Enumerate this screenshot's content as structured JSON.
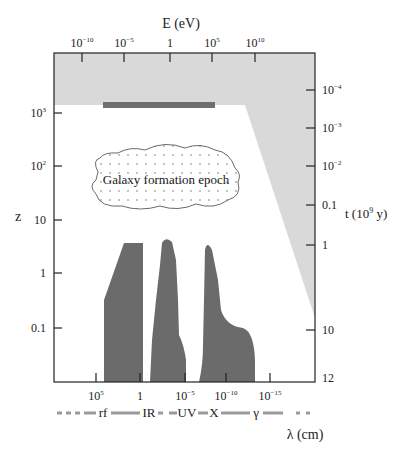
{
  "top_axis": {
    "title": "E (eV)",
    "ticks": [
      {
        "base": "10",
        "exp": "−10"
      },
      {
        "base": "10",
        "exp": "−5"
      },
      {
        "base": "1",
        "exp": ""
      },
      {
        "base": "10",
        "exp": "5"
      },
      {
        "base": "10",
        "exp": "10"
      }
    ]
  },
  "left_axis": {
    "title": "z",
    "ticks": [
      {
        "base": "10",
        "exp": "3"
      },
      {
        "base": "10",
        "exp": "2"
      },
      {
        "base": "10",
        "exp": ""
      },
      {
        "base": "1",
        "exp": ""
      },
      {
        "base": "0.1",
        "exp": ""
      }
    ]
  },
  "right_axis": {
    "title": "t (10",
    "title_exp": "9",
    "title_tail": " y)",
    "ticks": [
      {
        "base": "10",
        "exp": "−4"
      },
      {
        "base": "10",
        "exp": "−3"
      },
      {
        "base": "10",
        "exp": "−2"
      },
      {
        "base": "0.1",
        "exp": ""
      },
      {
        "base": "1",
        "exp": ""
      },
      {
        "base": "10",
        "exp": ""
      },
      {
        "base": "12",
        "exp": ""
      }
    ]
  },
  "bottom_axis": {
    "title": "λ (cm)",
    "ticks": [
      {
        "base": "10",
        "exp": "5"
      },
      {
        "base": "1",
        "exp": ""
      },
      {
        "base": "10",
        "exp": "−5"
      },
      {
        "base": "10",
        "exp": "−10"
      },
      {
        "base": "10",
        "exp": "−15"
      }
    ],
    "bands": [
      "rf",
      "IR",
      "UV",
      "X",
      "γ"
    ]
  },
  "annotations": {
    "galaxy_formation": "Galaxy formation epoch"
  },
  "colors": {
    "opaque_region": "#d9d9d9",
    "dark_bar": "#6f6f6f",
    "windows": "#6b6b6b",
    "band_line": "#9a9a9a"
  }
}
